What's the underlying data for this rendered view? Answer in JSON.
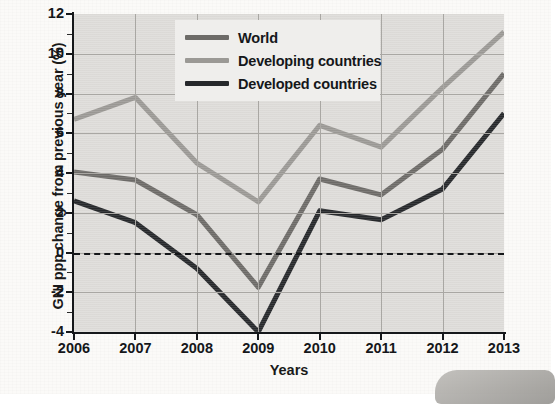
{
  "chart_data": {
    "type": "line",
    "title": "",
    "xlabel": "Years",
    "ylabel": "GNI ppp change from previous year (%)",
    "x": [
      2006,
      2007,
      2008,
      2009,
      2010,
      2011,
      2012,
      2013
    ],
    "categories": [
      "2006",
      "2007",
      "2008",
      "2009",
      "2010",
      "2011",
      "2012",
      "2013"
    ],
    "xlim": [
      2006,
      2013
    ],
    "ylim": [
      -4,
      12
    ],
    "yticks": [
      -4,
      -2,
      0,
      2,
      4,
      6,
      8,
      10,
      12
    ],
    "ytick_labels": [
      "-4",
      "-2",
      "0",
      "2",
      "4",
      "6",
      "8",
      "10",
      "12"
    ],
    "grid": true,
    "legend_position": "top-center",
    "zero_reference_line": true,
    "series": [
      {
        "name": "World",
        "color": "#6d6b68",
        "values": [
          4.05,
          3.65,
          1.9,
          -1.75,
          3.7,
          2.9,
          5.2,
          9.0
        ]
      },
      {
        "name": "Developing countries",
        "color": "#9b9995",
        "values": [
          6.7,
          7.8,
          4.5,
          2.55,
          6.4,
          5.3,
          8.3,
          11.1
        ]
      },
      {
        "name": "Developed countries",
        "color": "#26282b",
        "values": [
          2.6,
          1.5,
          -0.8,
          -4.0,
          2.1,
          1.65,
          3.2,
          7.0
        ]
      }
    ]
  },
  "legend": {
    "items": [
      {
        "label": "World",
        "color": "#6d6b68"
      },
      {
        "label": "Developing countries",
        "color": "#9b9995"
      },
      {
        "label": "Developed countries",
        "color": "#26282b"
      }
    ]
  },
  "colors": {
    "plot_background": "#dedcd9",
    "page_background": "#fbfaf8",
    "grid": "#a9a7a3",
    "axis": "#15171a",
    "legend_background": "#efeeec"
  }
}
